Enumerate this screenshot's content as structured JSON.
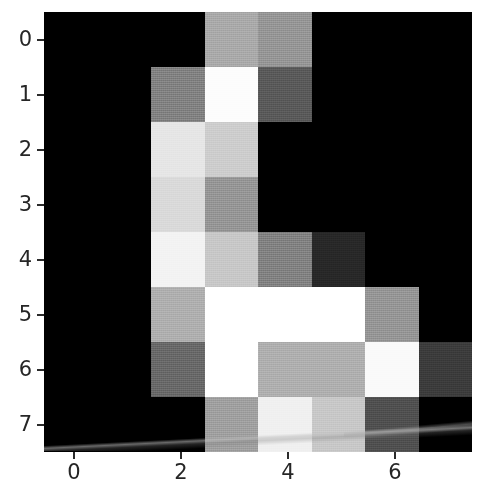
{
  "figure": {
    "type": "heatmap-image-plot",
    "background_color": "#ffffff",
    "colormap": "gray"
  },
  "axes": {
    "x": {
      "tick_labels": [
        "0",
        "2",
        "4",
        "6"
      ],
      "tick_values": [
        0,
        2,
        4,
        6
      ],
      "range": [
        -0.5,
        7.5
      ],
      "label": ""
    },
    "y": {
      "tick_labels": [
        "0",
        "1",
        "2",
        "3",
        "4",
        "5",
        "6",
        "7"
      ],
      "tick_values": [
        0,
        1,
        2,
        3,
        4,
        5,
        6,
        7
      ],
      "range": [
        7.5,
        -0.5
      ],
      "label": ""
    }
  },
  "chart_data": {
    "type": "heatmap",
    "title": "",
    "xlabel": "",
    "ylabel": "",
    "colormap": "gray",
    "vmin": 0,
    "vmax": 255,
    "xlim": [
      -0.5,
      7.5
    ],
    "ylim": [
      7.5,
      -0.5
    ],
    "grid": false,
    "legend": "none",
    "x": [
      0,
      1,
      2,
      3,
      4,
      5,
      6,
      7
    ],
    "y": [
      0,
      1,
      2,
      3,
      4,
      5,
      6,
      7
    ],
    "xtick_labels": [
      "0",
      "2",
      "4",
      "6"
    ],
    "ytick_labels": [
      "0",
      "1",
      "2",
      "3",
      "4",
      "5",
      "6",
      "7"
    ],
    "values": [
      [
        0,
        0,
        0,
        170,
        150,
        0,
        0,
        0
      ],
      [
        0,
        0,
        130,
        253,
        90,
        0,
        0,
        0
      ],
      [
        0,
        0,
        230,
        205,
        0,
        0,
        0,
        0
      ],
      [
        0,
        0,
        218,
        150,
        0,
        0,
        0,
        0
      ],
      [
        0,
        0,
        243,
        200,
        130,
        40,
        0,
        0
      ],
      [
        0,
        0,
        175,
        255,
        255,
        255,
        150,
        0
      ],
      [
        0,
        0,
        105,
        255,
        175,
        175,
        250,
        60
      ],
      [
        0,
        0,
        0,
        160,
        240,
        200,
        80,
        0
      ]
    ],
    "row_labels": [
      "0",
      "1",
      "2",
      "3",
      "4",
      "5",
      "6",
      "7"
    ],
    "column_labels": [
      "0",
      "1",
      "2",
      "3",
      "4",
      "5",
      "6",
      "7"
    ],
    "annotation": "8x8 grayscale handwritten-digit image"
  },
  "colors": {
    "tick_text": "#262626",
    "tick_mark": "#2b2b2b",
    "background": "#ffffff"
  }
}
